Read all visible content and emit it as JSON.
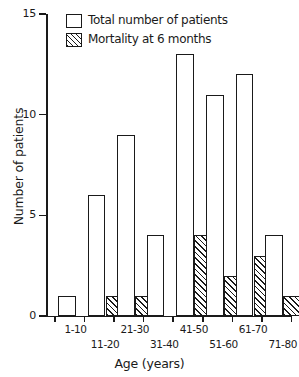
{
  "chart_data": {
    "type": "bar",
    "title": "",
    "subtitle": "",
    "xlabel": "Age (years)",
    "ylabel": "Number of patients",
    "categories": [
      "1-10",
      "11-20",
      "21-30",
      "31-40",
      "41-50",
      "51-60",
      "61-70",
      "71-80"
    ],
    "series": [
      {
        "name": "Total number of patients",
        "values": [
          1,
          6,
          9,
          4,
          13,
          11,
          12,
          4
        ],
        "style": "open",
        "color": "#ffffff"
      },
      {
        "name": "Mortality at 6 months",
        "values": [
          0,
          1,
          1,
          0,
          4,
          2,
          3,
          1
        ],
        "style": "hatched",
        "color": "#1a1a1a"
      }
    ],
    "ylim": [
      0,
      15
    ],
    "yticks": [
      0,
      5,
      10,
      15
    ],
    "ytick_labels": [
      "0",
      "5",
      "10",
      "15"
    ],
    "grid": false,
    "legend_position": "top-left",
    "axis_color": "#1a1a1a",
    "background": "#ffffff"
  },
  "legend": {
    "items": [
      {
        "label": "Total number of patients",
        "swatch": "open-square-icon"
      },
      {
        "label": "Mortality at 6 months",
        "swatch": "hatched-square-icon"
      }
    ]
  },
  "axes": {
    "y_title": "Number of patients",
    "x_title": "Age (years)",
    "y_tick_labels": [
      "0",
      "5",
      "10",
      "15"
    ],
    "x_tick_labels": [
      "1-10",
      "11-20",
      "21-30",
      "31-40",
      "41-50",
      "51-60",
      "61-70",
      "71-80"
    ]
  }
}
